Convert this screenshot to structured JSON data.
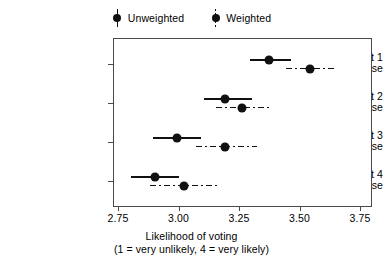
{
  "chart_data": {
    "type": "scatter",
    "subtype": "dot-and-whisker-plot",
    "title": "",
    "xlabel": "Likelihood of voting",
    "xlabel_sub": "(1 = very unlikely, 4 = very likely)",
    "ylabel": "",
    "xlim": [
      2.75,
      3.75
    ],
    "xticks": [
      2.75,
      3.0,
      3.25,
      3.5,
      3.75
    ],
    "xticklabels": [
      "2.75",
      "3.00",
      "3.25",
      "3.50",
      "3.75"
    ],
    "grid": false,
    "legend_position": "top-center",
    "categories": [
      "Treatment 1 Important, Close",
      "Treatment 2 Important, Not close",
      "Treatment 3 Unimportant, Close",
      "Treatment 4 Unimportant, Not close"
    ],
    "category_labels": [
      {
        "line1": "Treatment 1",
        "line2": "Important, Close"
      },
      {
        "line1": "Treatment 2",
        "line2": "Important, Not close"
      },
      {
        "line1": "Treatment 3",
        "line2": "Unimportant, Close"
      },
      {
        "line1": "Treatment 4",
        "line2": "Unimportant, Not close"
      }
    ],
    "series": [
      {
        "name": "Unweighted",
        "linestyle": "solid",
        "marker": "circle",
        "color": "#111111",
        "values": [
          3.37,
          3.19,
          2.99,
          2.9
        ],
        "ci_low": [
          3.29,
          3.1,
          2.89,
          2.8
        ],
        "ci_high": [
          3.46,
          3.3,
          3.09,
          3.0
        ]
      },
      {
        "name": "Weighted",
        "linestyle": "dashdot",
        "marker": "circle",
        "color": "#111111",
        "values": [
          3.54,
          3.26,
          3.19,
          3.02
        ],
        "ci_low": [
          3.44,
          3.15,
          3.07,
          2.88
        ],
        "ci_high": [
          3.64,
          3.38,
          3.32,
          3.16
        ]
      }
    ]
  },
  "legend": {
    "items": [
      {
        "label": "Unweighted",
        "style": "solid"
      },
      {
        "label": "Weighted",
        "style": "dashdot"
      }
    ]
  }
}
